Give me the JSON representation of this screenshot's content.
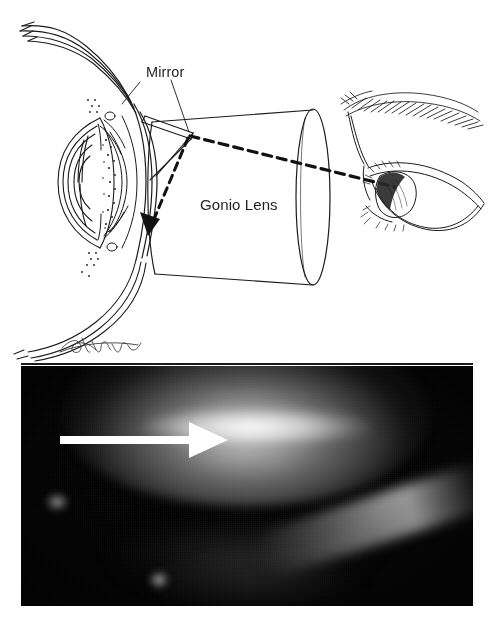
{
  "figure": {
    "background_color": "#ffffff"
  },
  "diagram": {
    "name": "gonioscopy-schematic",
    "labels": {
      "mirror": "Mirror",
      "gonio_lens": "Gonio Lens"
    },
    "label_color": "#231f20",
    "line_color": "#1a1a1a",
    "parts": {
      "eye_cross_section": "eye-cross-section",
      "cornea": "cornea",
      "lens": "crystalline-lens",
      "iris": "iris",
      "angle": "anterior-chamber-angle",
      "sclera": "sclera",
      "gonio_lens_cone": "gonio-lens-cone",
      "gonio_lens_face": "gonio-lens-face",
      "mirror_plate": "mirror-plate",
      "observer_eye": "observer-eye",
      "eyebrow": "eyebrow",
      "eyelashes": "eyelashes",
      "light_path": "dashed-light-path",
      "angle_arrow": "dashed-angle-arrow",
      "signature": "artist-signature"
    }
  },
  "photograph": {
    "name": "gonioscopic-photograph",
    "description": "Gonioscopic view of the anterior chamber angle; a white arrow indicates the angle structures.",
    "background_color": "#020202",
    "arrow": {
      "name": "angle-pointer-arrow",
      "color": "#ffffff",
      "direction": "right",
      "shaft_start_x": 39,
      "shaft_end_x": 172,
      "tip_x": 207,
      "y": 74
    },
    "features": [
      {
        "name": "superior-bright-band",
        "description": "Broad illuminated band across the upper field"
      },
      {
        "name": "bright-core-highlight",
        "description": "Bright core of the angle recess highlight"
      },
      {
        "name": "inferior-diagonal-streak",
        "description": "Diagonal bright streak in the lower right"
      },
      {
        "name": "specular-reflection-left",
        "description": "Small bright reflection at left"
      },
      {
        "name": "specular-reflection-bottom",
        "description": "Small bright reflection at bottom"
      }
    ]
  }
}
